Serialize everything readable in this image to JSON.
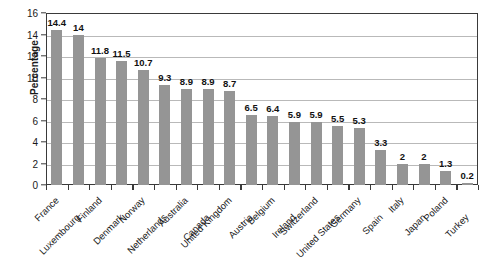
{
  "chart_data": {
    "type": "bar",
    "title": "",
    "xlabel": "",
    "ylabel": "Percentage",
    "ylim": [
      0,
      16
    ],
    "y_ticks": [
      0,
      2,
      4,
      6,
      8,
      10,
      12,
      14,
      16
    ],
    "grid": true,
    "legend": "none",
    "bar_color": "#959595",
    "categories": [
      "France",
      "Luxembourg",
      "Finland",
      "Denmark",
      "Norway",
      "Netherlands",
      "Australia",
      "Canada",
      "United Kingdom",
      "Austria",
      "Belgium",
      "Ireland",
      "Switzerland",
      "United States",
      "Germany",
      "Spain",
      "Italy",
      "Japan",
      "Poland",
      "Turkey"
    ],
    "values": [
      14.4,
      14,
      11.8,
      11.5,
      10.7,
      9.3,
      8.9,
      8.9,
      8.7,
      6.5,
      6.4,
      5.9,
      5.9,
      5.5,
      5.3,
      3.3,
      2,
      2,
      1.3,
      0.2
    ],
    "value_labels": [
      "14.4",
      "14",
      "11.8",
      "11.5",
      "10.7",
      "9.3",
      "8.9",
      "8.9",
      "8.7",
      "6.5",
      "6.4",
      "5.9",
      "5.9",
      "5.5",
      "5.3",
      "3.3",
      "2",
      "2",
      "1.3",
      "0.2"
    ]
  }
}
